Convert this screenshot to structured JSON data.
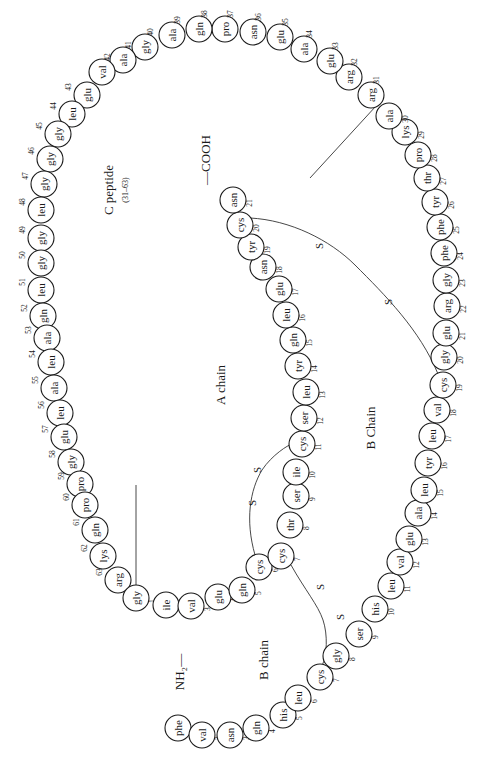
{
  "diagram": {
    "labels": {
      "c_peptide": "C peptide",
      "c_peptide_range": "(31–63)",
      "a_chain": "A chain",
      "b_chain_upper": "B Chain",
      "b_chain_lower": "B chain",
      "cooh": "—COOH",
      "nh2": "NH₂—",
      "disulfide": "S"
    },
    "colors": {
      "stroke": "#1a1a1a",
      "background": "#ffffff"
    },
    "circle_radius": 13,
    "c_peptide": [
      {
        "n": 31,
        "aa": "arg",
        "x": 371,
        "y": 95
      },
      {
        "n": 32,
        "aa": "arg",
        "x": 349,
        "y": 77
      },
      {
        "n": 33,
        "aa": "glu",
        "x": 330,
        "y": 61
      },
      {
        "n": 34,
        "aa": "ala",
        "x": 304,
        "y": 49
      },
      {
        "n": 35,
        "aa": "glu",
        "x": 280,
        "y": 37
      },
      {
        "n": 36,
        "aa": "asn",
        "x": 253,
        "y": 32
      },
      {
        "n": 37,
        "aa": "pro",
        "x": 225,
        "y": 29
      },
      {
        "n": 38,
        "aa": "gln",
        "x": 199,
        "y": 29
      },
      {
        "n": 39,
        "aa": "ala",
        "x": 172,
        "y": 35
      },
      {
        "n": 40,
        "aa": "gly",
        "x": 145,
        "y": 47
      },
      {
        "n": 41,
        "aa": "ala",
        "x": 123,
        "y": 60
      },
      {
        "n": 42,
        "aa": "val",
        "x": 102,
        "y": 72
      },
      {
        "n": 43,
        "aa": "glu",
        "x": 87,
        "y": 95
      },
      {
        "n": 44,
        "aa": "leu",
        "x": 72,
        "y": 114
      },
      {
        "n": 45,
        "aa": "gly",
        "x": 58,
        "y": 134
      },
      {
        "n": 46,
        "aa": "gly",
        "x": 50,
        "y": 159
      },
      {
        "n": 47,
        "aa": "gly",
        "x": 44,
        "y": 184
      },
      {
        "n": 48,
        "aa": "leu",
        "x": 41,
        "y": 210
      },
      {
        "n": 49,
        "aa": "gly",
        "x": 41,
        "y": 238
      },
      {
        "n": 50,
        "aa": "gly",
        "x": 41,
        "y": 263
      },
      {
        "n": 51,
        "aa": "leu",
        "x": 41,
        "y": 290
      },
      {
        "n": 52,
        "aa": "gln",
        "x": 43,
        "y": 316
      },
      {
        "n": 53,
        "aa": "ala",
        "x": 47,
        "y": 338
      },
      {
        "n": 54,
        "aa": "leu",
        "x": 51,
        "y": 362
      },
      {
        "n": 55,
        "aa": "ala",
        "x": 54,
        "y": 388
      },
      {
        "n": 56,
        "aa": "leu",
        "x": 60,
        "y": 413
      },
      {
        "n": 57,
        "aa": "glu",
        "x": 64,
        "y": 437
      },
      {
        "n": 58,
        "aa": "gly",
        "x": 71,
        "y": 462
      },
      {
        "n": 59,
        "aa": "pro",
        "x": 80,
        "y": 484
      },
      {
        "n": 60,
        "aa": "pro",
        "x": 85,
        "y": 505
      },
      {
        "n": 61,
        "aa": "gln",
        "x": 95,
        "y": 530
      },
      {
        "n": 62,
        "aa": "lys",
        "x": 103,
        "y": 556
      },
      {
        "n": 63,
        "aa": "arg",
        "x": 118,
        "y": 580
      }
    ],
    "a_chain": [
      {
        "n": 1,
        "aa": "gly",
        "x": 136,
        "y": 598
      },
      {
        "n": 2,
        "aa": "ile",
        "x": 166,
        "y": 605
      },
      {
        "n": 3,
        "aa": "val",
        "x": 191,
        "y": 606
      },
      {
        "n": 4,
        "aa": "glu",
        "x": 218,
        "y": 597
      },
      {
        "n": 5,
        "aa": "gln",
        "x": 242,
        "y": 590
      },
      {
        "n": 6,
        "aa": "cys",
        "x": 259,
        "y": 567
      },
      {
        "n": 7,
        "aa": "cys",
        "x": 281,
        "y": 556
      },
      {
        "n": 8,
        "aa": "thr",
        "x": 290,
        "y": 525
      },
      {
        "n": 9,
        "aa": "ser",
        "x": 296,
        "y": 496
      },
      {
        "n": 10,
        "aa": "ile",
        "x": 296,
        "y": 472
      },
      {
        "n": 11,
        "aa": "cys",
        "x": 302,
        "y": 444
      },
      {
        "n": 12,
        "aa": "ser",
        "x": 304,
        "y": 418
      },
      {
        "n": 13,
        "aa": "leu",
        "x": 306,
        "y": 392
      },
      {
        "n": 14,
        "aa": "tyr",
        "x": 298,
        "y": 366
      },
      {
        "n": 15,
        "aa": "gln",
        "x": 293,
        "y": 340
      },
      {
        "n": 16,
        "aa": "leu",
        "x": 286,
        "y": 315
      },
      {
        "n": 17,
        "aa": "glu",
        "x": 279,
        "y": 289
      },
      {
        "n": 18,
        "aa": "asn",
        "x": 263,
        "y": 267
      },
      {
        "n": 19,
        "aa": "tyr",
        "x": 251,
        "y": 247
      },
      {
        "n": 20,
        "aa": "cys",
        "x": 240,
        "y": 225
      },
      {
        "n": 21,
        "aa": "asn",
        "x": 233,
        "y": 200
      }
    ],
    "b_chain": [
      {
        "n": 1,
        "aa": "phe",
        "x": 178,
        "y": 728
      },
      {
        "n": 2,
        "aa": "val",
        "x": 202,
        "y": 735
      },
      {
        "n": 3,
        "aa": "asn",
        "x": 230,
        "y": 735
      },
      {
        "n": 4,
        "aa": "gln",
        "x": 256,
        "y": 728
      },
      {
        "n": 5,
        "aa": "his",
        "x": 283,
        "y": 715
      },
      {
        "n": 6,
        "aa": "leu",
        "x": 298,
        "y": 698
      },
      {
        "n": 7,
        "aa": "cys",
        "x": 320,
        "y": 677
      },
      {
        "n": 8,
        "aa": "gly",
        "x": 336,
        "y": 656
      },
      {
        "n": 9,
        "aa": "ser",
        "x": 359,
        "y": 634
      },
      {
        "n": 10,
        "aa": "his",
        "x": 375,
        "y": 609
      },
      {
        "n": 11,
        "aa": "leu",
        "x": 391,
        "y": 586
      },
      {
        "n": 12,
        "aa": "val",
        "x": 400,
        "y": 562
      },
      {
        "n": 13,
        "aa": "glu",
        "x": 409,
        "y": 539
      },
      {
        "n": 14,
        "aa": "ala",
        "x": 418,
        "y": 513
      },
      {
        "n": 15,
        "aa": "leu",
        "x": 424,
        "y": 490
      },
      {
        "n": 16,
        "aa": "tyr",
        "x": 428,
        "y": 463
      },
      {
        "n": 17,
        "aa": "leu",
        "x": 432,
        "y": 436
      },
      {
        "n": 18,
        "aa": "val",
        "x": 437,
        "y": 410
      },
      {
        "n": 19,
        "aa": "cys",
        "x": 443,
        "y": 385
      },
      {
        "n": 20,
        "aa": "gly",
        "x": 444,
        "y": 357
      },
      {
        "n": 21,
        "aa": "glu",
        "x": 446,
        "y": 333
      },
      {
        "n": 22,
        "aa": "arg",
        "x": 447,
        "y": 306
      },
      {
        "n": 23,
        "aa": "gly",
        "x": 446,
        "y": 280
      },
      {
        "n": 24,
        "aa": "phe",
        "x": 444,
        "y": 253
      },
      {
        "n": 25,
        "aa": "phe",
        "x": 440,
        "y": 227
      },
      {
        "n": 26,
        "aa": "tyr",
        "x": 435,
        "y": 202
      },
      {
        "n": 27,
        "aa": "thr",
        "x": 427,
        "y": 178
      },
      {
        "n": 28,
        "aa": "pro",
        "x": 418,
        "y": 155
      },
      {
        "n": 29,
        "aa": "lys",
        "x": 405,
        "y": 132
      },
      {
        "n": 30,
        "aa": "ala",
        "x": 389,
        "y": 116
      }
    ],
    "disulfide_bonds": [
      {
        "from": "A6",
        "to": "A11"
      },
      {
        "from": "A7",
        "to": "B7"
      },
      {
        "from": "A20",
        "to": "B19"
      }
    ]
  }
}
